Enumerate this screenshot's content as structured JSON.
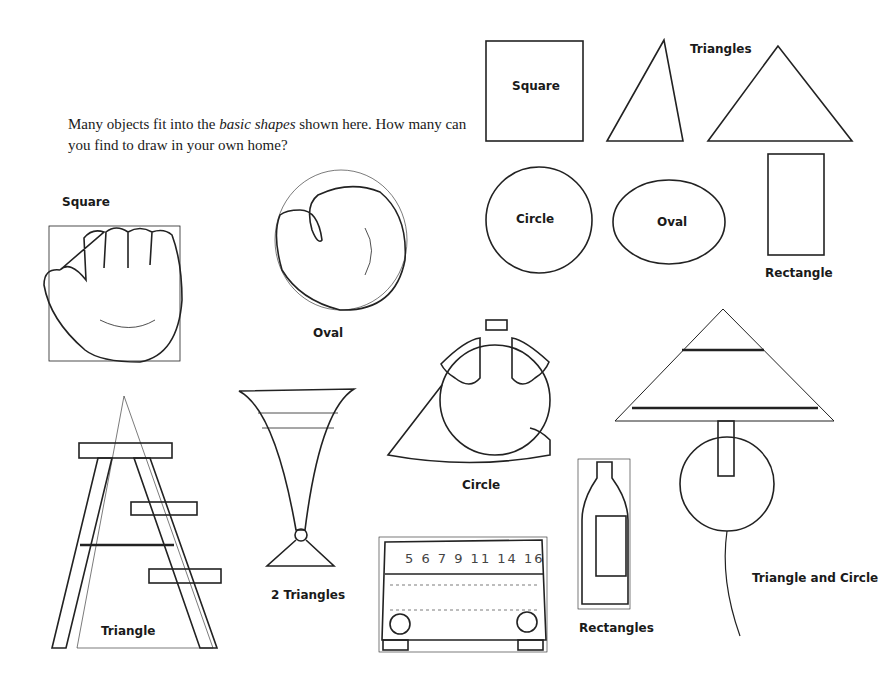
{
  "intro": {
    "part1": "Many objects fit into the ",
    "emphasis": "basic shapes",
    "part2": " shown here.  How many can you find to draw in your own home?"
  },
  "basic_shapes": {
    "square": "Square",
    "triangles": "Triangles",
    "circle": "Circle",
    "oval": "Oval",
    "rectangle": "Rectangle"
  },
  "objects": [
    {
      "object": "baseball glove",
      "label": "Square"
    },
    {
      "object": "boxing glove",
      "label": "Oval"
    },
    {
      "object": "canteen",
      "label": "Circle"
    },
    {
      "object": "table lamp",
      "label": "Triangle and Circle"
    },
    {
      "object": "stepladder",
      "label": "Triangle"
    },
    {
      "object": "vase",
      "label": "2 Triangles"
    },
    {
      "object": "radio",
      "label": "",
      "dial_numbers": [
        "5",
        "6",
        "7",
        "9",
        "11",
        "14",
        "16"
      ]
    },
    {
      "object": "bottle",
      "label": "Rectangles"
    }
  ],
  "colors": {
    "ink": "#1a1a1a",
    "paper": "#ffffff"
  }
}
